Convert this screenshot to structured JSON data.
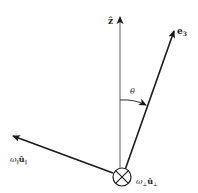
{
  "diagram": {
    "labels": {
      "z_axis": "ẑ",
      "e3": "e",
      "e3_sub": "3",
      "theta": "θ",
      "omega_parallel": "ω",
      "omega_parallel_sub1": "∥",
      "omega_parallel_u": "û",
      "omega_parallel_sub2": "∥",
      "omega_perp": "ω",
      "omega_perp_sub1": "⊥",
      "omega_perp_u": "û",
      "omega_perp_sub2": "⊥"
    },
    "colors": {
      "line": "#1a1a1a",
      "axis": "#7a7a7a",
      "background": "#ffffff"
    }
  }
}
